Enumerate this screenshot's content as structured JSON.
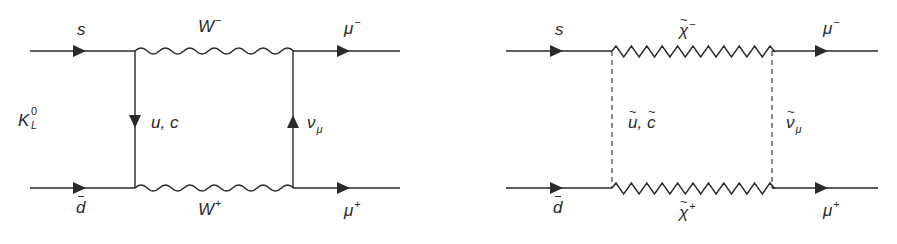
{
  "colors": {
    "line": "#2a2a2a",
    "background": "#ffffff"
  },
  "diagrams": [
    {
      "name": "standard-model-box",
      "labels": {
        "s": "s",
        "dbar": "d",
        "kaon": "K",
        "kaon_sup": "0",
        "kaon_sub": "L",
        "w_minus": "W",
        "w_minus_sup": "−",
        "w_plus": "W",
        "w_plus_sup": "+",
        "internal_quark": "u, c",
        "neutrino": "ν",
        "neutrino_sub": "μ",
        "mu_minus": "μ",
        "mu_minus_sup": "−",
        "mu_plus": "μ",
        "mu_plus_sup": "+"
      },
      "propagators": {
        "top": "wavy",
        "bottom": "wavy",
        "left": "solid-arrow-down",
        "right": "solid-arrow-up"
      }
    },
    {
      "name": "supersymmetric-box",
      "labels": {
        "s": "s",
        "dbar": "d",
        "chargino_minus": "χ",
        "chargino_minus_sup": "−",
        "chargino_plus": "χ",
        "chargino_plus_sup": "+",
        "squark_u": "u",
        "squark_sep": ", ",
        "squark_c": "c",
        "sneutrino": "ν",
        "sneutrino_sub": "μ",
        "mu_minus": "μ",
        "mu_minus_sup": "−",
        "mu_plus": "μ",
        "mu_plus_sup": "+"
      },
      "propagators": {
        "top": "zigzag",
        "bottom": "zigzag",
        "left": "dashed",
        "right": "dashed"
      }
    }
  ]
}
